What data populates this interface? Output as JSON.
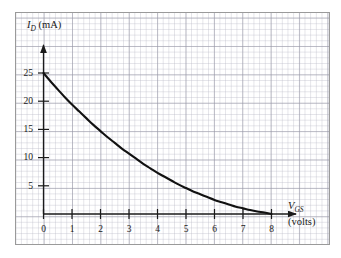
{
  "figure": {
    "kind": "jfet-transfer-characteristic-graph",
    "background_color": "#ffffff",
    "grid_color": "#9696a5",
    "curve_color": "#111111",
    "axis_color": "#1a1a1a"
  },
  "axes": {
    "y": {
      "label_symbol": "I",
      "label_subscript": "D",
      "label_units": "(mA)",
      "label_full": "ID (mA)",
      "ticks": [
        {
          "value": 25,
          "text": "25"
        },
        {
          "value": 20,
          "text": "20"
        },
        {
          "value": 15,
          "text": "15"
        },
        {
          "value": 10,
          "text": "10"
        },
        {
          "value": 5,
          "text": "5"
        }
      ],
      "min": 0,
      "max": 28
    },
    "x": {
      "label_symbol": "V",
      "label_subscript": "GS",
      "label_units": "(volts)",
      "label_full": "VGS (volts)",
      "ticks": [
        {
          "value": 0,
          "text": "0"
        },
        {
          "value": 1,
          "text": "1"
        },
        {
          "value": 2,
          "text": "2"
        },
        {
          "value": 3,
          "text": "3"
        },
        {
          "value": 4,
          "text": "4"
        },
        {
          "value": 5,
          "text": "5"
        },
        {
          "value": 6,
          "text": "6"
        },
        {
          "value": 7,
          "text": "7"
        },
        {
          "value": 8,
          "text": "8"
        }
      ],
      "min": 0,
      "max": 9.2
    }
  },
  "chart_data": {
    "type": "line",
    "title": "",
    "xlabel": "VGS (volts)",
    "ylabel": "ID (mA)",
    "xlim": [
      0,
      9.2
    ],
    "ylim": [
      0,
      28
    ],
    "grid": true,
    "legend": false,
    "xticks": [
      0,
      1,
      2,
      3,
      4,
      5,
      6,
      7,
      8
    ],
    "yticks": [
      5,
      10,
      15,
      20,
      25
    ],
    "series": [
      {
        "name": "ID vs VGS",
        "x": [
          0,
          0.25,
          0.5,
          0.75,
          1,
          1.25,
          1.5,
          1.75,
          2,
          2.25,
          2.5,
          2.75,
          3,
          3.25,
          3.5,
          3.75,
          4,
          4.25,
          4.5,
          4.75,
          5,
          5.25,
          5.5,
          5.75,
          6,
          6.25,
          6.5,
          6.75,
          7,
          7.25,
          7.5,
          7.75,
          8
        ],
        "y": [
          25.0,
          23.5,
          22.1,
          20.7,
          19.4,
          18.2,
          17.0,
          15.8,
          14.7,
          13.6,
          12.6,
          11.6,
          10.7,
          9.8,
          8.9,
          8.1,
          7.3,
          6.6,
          5.9,
          5.2,
          4.6,
          4.0,
          3.5,
          3.0,
          2.5,
          2.1,
          1.7,
          1.3,
          1.0,
          0.7,
          0.45,
          0.25,
          0.0
        ]
      }
    ],
    "annotations": [
      {
        "text": "IDSS = 25 mA at VGS = 0",
        "visible_on_chart": false
      },
      {
        "text": "VP = 8 volts (pinch-off)",
        "visible_on_chart": false
      }
    ]
  }
}
